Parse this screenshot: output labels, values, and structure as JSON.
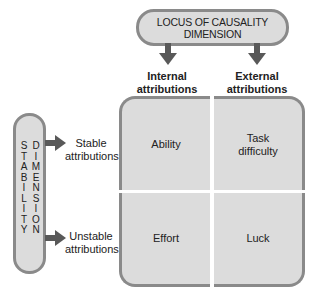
{
  "locus_dimension": {
    "line1": "LOCUS OF CAUSALITY",
    "line2": "DIMENSION"
  },
  "stability_dimension": {
    "column1": [
      "S",
      "T",
      "A",
      "B",
      "I",
      "L",
      "I",
      "T",
      "Y"
    ],
    "column2": [
      "D",
      "I",
      "M",
      "E",
      "N",
      "S",
      "I",
      "O",
      "N"
    ]
  },
  "column_headers": [
    {
      "line1": "Internal",
      "line2": "attributions"
    },
    {
      "line1": "External",
      "line2": "attributions"
    }
  ],
  "row_headers": [
    {
      "line1": "Stable",
      "line2": "attributions"
    },
    {
      "line1": "Unstable",
      "line2": "attributions"
    }
  ],
  "cells": {
    "stable_internal": {
      "line1": "Ability",
      "line2": ""
    },
    "stable_external": {
      "line1": "Task",
      "line2": "difficulty"
    },
    "unstable_internal": {
      "line1": "Effort",
      "line2": ""
    },
    "unstable_external": {
      "line1": "Luck",
      "line2": ""
    }
  },
  "colors": {
    "box_fill": "#dcdcdc",
    "box_border": "#8a8a8a",
    "arrow": "#595959",
    "text": "#222222"
  }
}
